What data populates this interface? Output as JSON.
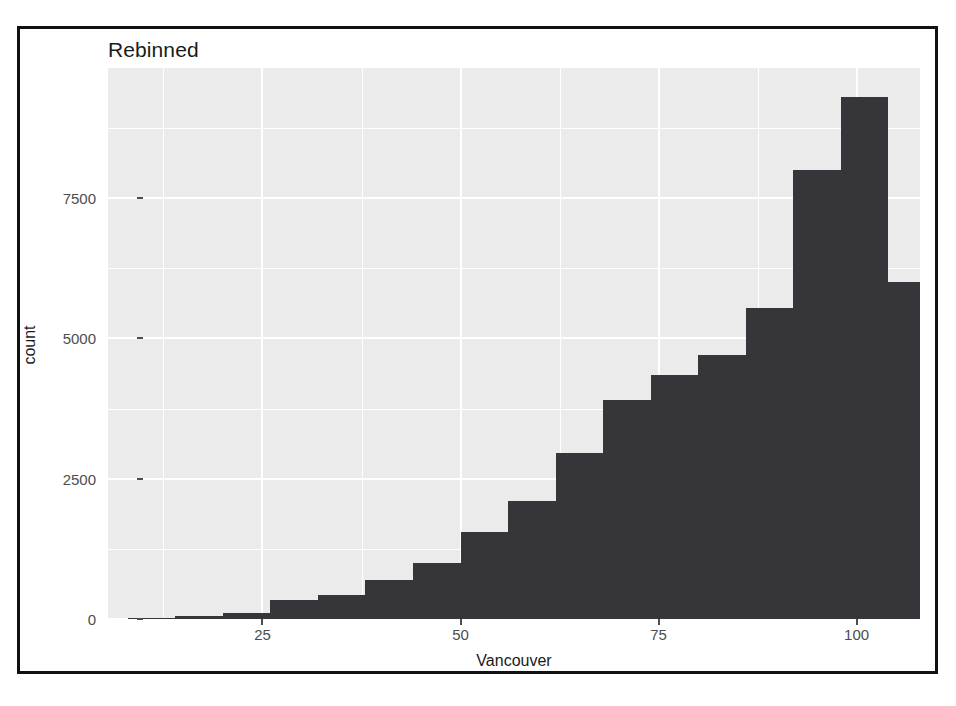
{
  "chart_data": {
    "type": "bar",
    "title": "Rebinned",
    "xlabel": "Vancouver",
    "ylabel": "count",
    "grid": true,
    "legend": null,
    "xlim": [
      5.5,
      108.0
    ],
    "ylim": [
      0,
      9820
    ],
    "xticks": [
      25,
      50,
      75,
      100
    ],
    "xtick_labels": [
      "25",
      "50",
      "75",
      "100"
    ],
    "yticks": [
      0,
      2500,
      5000,
      7500
    ],
    "ytick_labels": [
      "0",
      "2500",
      "5000",
      "7500"
    ],
    "bar_color": "#35353a",
    "panel_color": "#ebebeb",
    "grid_color": "#ffffff",
    "bin_width": 6,
    "bin_starts": [
      8,
      14,
      20,
      26,
      32,
      38,
      44,
      50,
      56,
      62,
      68,
      74,
      80,
      86,
      92,
      98
    ],
    "bin_labels": [
      "8-14",
      "14-20",
      "20-26",
      "26-32",
      "32-38",
      "38-44",
      "44-50",
      "50-56",
      "56-62",
      "62-68",
      "68-74",
      "74-80",
      "80-86",
      "86-92",
      "92-98",
      "98-104"
    ],
    "categories": [
      "8",
      "14",
      "20",
      "26",
      "32",
      "38",
      "44",
      "50",
      "56",
      "62",
      "68",
      "74",
      "80",
      "86",
      "92",
      "98"
    ],
    "values": [
      20,
      60,
      110,
      230,
      330,
      560,
      870,
      1230,
      1700,
      2300,
      2950,
      3900,
      4350,
      4700,
      5550,
      6000
    ],
    "series": [
      {
        "name": "count",
        "values": [
          20,
          60,
          110,
          230,
          330,
          560,
          870,
          1230,
          1700,
          2300,
          2950,
          3900,
          4350,
          4700,
          5550,
          6000
        ]
      }
    ]
  },
  "chart_bars": [
    {
      "x0": 8,
      "x1": 14,
      "count": 20
    },
    {
      "x0": 14,
      "x1": 20,
      "count": 60
    },
    {
      "x0": 20,
      "x1": 26,
      "count": 110
    },
    {
      "x0": 26,
      "x1": 32,
      "count": 330
    },
    {
      "x0": 32,
      "x1": 38,
      "count": 430
    },
    {
      "x0": 38,
      "x1": 44,
      "count": 700
    },
    {
      "x0": 44,
      "x1": 50,
      "count": 1000
    },
    {
      "x0": 50,
      "x1": 56,
      "count": 1550
    },
    {
      "x0": 56,
      "x1": 62,
      "count": 2100
    },
    {
      "x0": 62,
      "x1": 68,
      "count": 2950
    },
    {
      "x0": 68,
      "x1": 74,
      "count": 3900
    },
    {
      "x0": 74,
      "x1": 80,
      "count": 4350
    },
    {
      "x0": 80,
      "x1": 86,
      "count": 4700
    },
    {
      "x0": 86,
      "x1": 92,
      "count": 5550
    },
    {
      "x0": 92,
      "x1": 98,
      "count": 8000
    },
    {
      "x0": 98,
      "x1": 104,
      "count": 9300
    },
    {
      "x0": 104,
      "x1": 108,
      "count": 6000
    }
  ]
}
